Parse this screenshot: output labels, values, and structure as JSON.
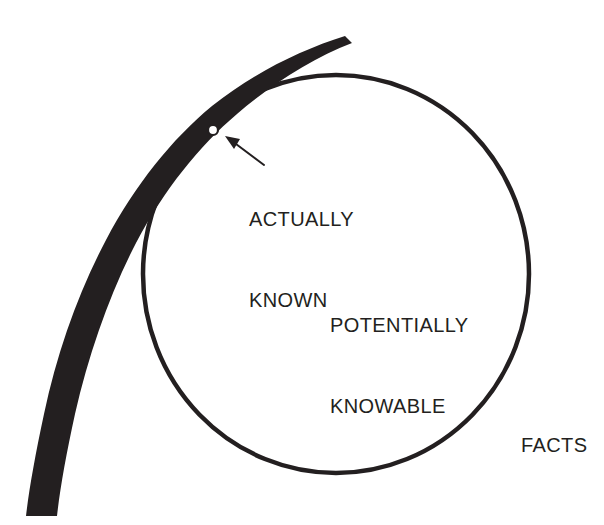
{
  "diagram": {
    "background_color": "#ffffff",
    "ink_color": "#231f20",
    "labels": {
      "actually_known": {
        "line1": "ACTUALLY",
        "line2": "KNOWN"
      },
      "potentially_knowable": {
        "line1": "POTENTIALLY",
        "line2": "KNOWABLE"
      },
      "facts": {
        "line1": "FACTS"
      }
    },
    "shapes": {
      "facts_band": {
        "name": "facts-band",
        "description": "thick tapering black swath sweeping from lower-left up to a point at upper-right",
        "fill": "#231f20"
      },
      "knowable_circle": {
        "name": "potentially-knowable-circle",
        "description": "large outlined circle",
        "stroke": "#231f20",
        "stroke_width": 4,
        "fill": "none"
      },
      "known_dot": {
        "name": "actually-known-circle",
        "description": "tiny open circle on the rim where band and circle meet",
        "stroke": "#231f20",
        "stroke_width": 2,
        "fill": "#ffffff",
        "radius": 5
      },
      "pointer_arrow": {
        "name": "callout-arrow",
        "description": "thin arrow pointing up-left from the ACTUALLY KNOWN label to the tiny circle",
        "stroke": "#231f20",
        "stroke_width": 2
      }
    }
  }
}
